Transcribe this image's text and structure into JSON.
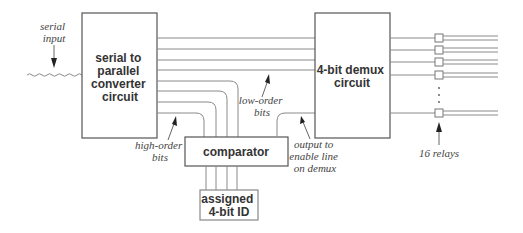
{
  "diagram": {
    "blocks": {
      "converter": {
        "lines": [
          "serial to",
          "parallel",
          "converter",
          "circuit"
        ]
      },
      "demux": {
        "lines": [
          "4-bit demux",
          "circuit"
        ]
      },
      "comparator": {
        "lines": [
          "comparator"
        ]
      },
      "assigned_id": {
        "lines": [
          "assigned",
          "4-bit ID"
        ]
      }
    },
    "annotations": {
      "serial_input": [
        "serial",
        "input"
      ],
      "high_order_bits": [
        "high-order",
        "bits"
      ],
      "low_order_bits": [
        "low-order",
        "bits"
      ],
      "output_enable": [
        "output to",
        "enable line",
        "on demux"
      ],
      "relays": [
        "16 relays"
      ]
    },
    "relay_count_visible": 5,
    "relay_count_total": 16,
    "parallel_bit_lines": 8,
    "low_order_lines": 4,
    "high_order_lines": 4
  }
}
